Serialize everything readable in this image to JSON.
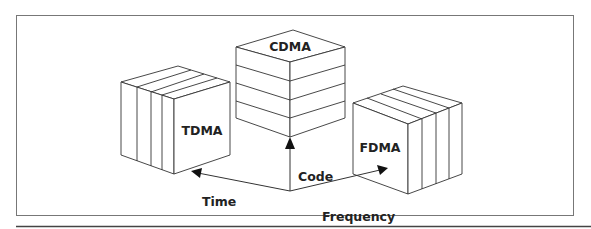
{
  "figure": {
    "title_labels": {
      "cdma": "CDMA",
      "tdma": "TDMA",
      "fdma": "FDMA"
    },
    "axes": {
      "code": "Code",
      "time": "Time",
      "frequency": "Frequency"
    },
    "colors": {
      "stroke": "#333333",
      "frame": "#777777",
      "rule": "#444444",
      "background": "#ffffff"
    }
  }
}
